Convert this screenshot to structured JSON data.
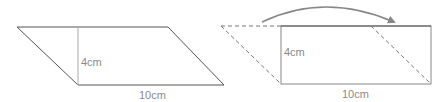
{
  "figures": {
    "left": {
      "shape": "parallelogram",
      "height_label": "4cm",
      "base_label": "10cm"
    },
    "right": {
      "shape": "rectangle formed from parallelogram",
      "height_label": "4cm",
      "base_label": "10cm",
      "arrow": "curved-arrow-right"
    }
  },
  "colors": {
    "outline": "#555555",
    "height_line": "#aaaaaa",
    "dashed": "#777777",
    "arrow": "#888888",
    "label": "#8a8a8a"
  }
}
